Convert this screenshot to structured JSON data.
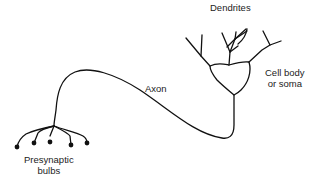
{
  "diagram": {
    "labels": {
      "dendrites": "Dendrites",
      "cell_body_line1": "Cell body",
      "cell_body_line2": "or soma",
      "axon": "Axon",
      "presynaptic_line1": "Presynaptic",
      "presynaptic_line2": "bulbs"
    },
    "colors": {
      "stroke": "#111111",
      "background": "#ffffff"
    }
  }
}
